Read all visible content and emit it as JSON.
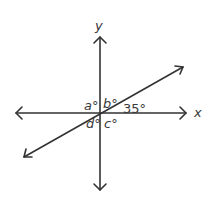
{
  "diagram": {
    "type": "intersecting lines on coordinate axes",
    "axes": {
      "x_label": "x",
      "y_label": "y"
    },
    "angle_labels": {
      "a": "a°",
      "b": "b°",
      "c": "c°",
      "d": "d°",
      "given": "35°"
    },
    "colors": {
      "line": "#333333",
      "text": "#3a3a3a",
      "background": "#ffffff"
    }
  }
}
